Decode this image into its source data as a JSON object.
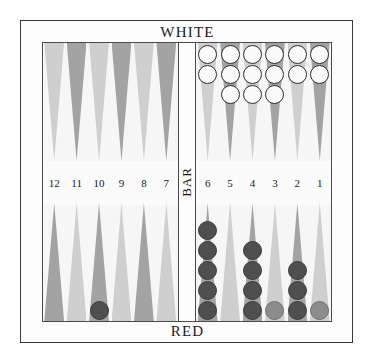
{
  "board": {
    "title_top": "WHITE",
    "title_bottom": "RED",
    "bar_label": "BAR",
    "colors": {
      "point_light": "#cfcfcf",
      "point_dark": "#a3a3a3",
      "checker_white": "#fbfbfb",
      "checker_red": "#4f4f4f",
      "checker_red_light": "#8d8d8d",
      "frame": "#3a3a3a",
      "felt": "#f6f6f6"
    }
  },
  "points": {
    "left_top": [
      {
        "number": "12",
        "shade": "light",
        "checkers": 0,
        "color": "none"
      },
      {
        "number": "11",
        "shade": "dark",
        "checkers": 0,
        "color": "none"
      },
      {
        "number": "10",
        "shade": "light",
        "checkers": 0,
        "color": "none"
      },
      {
        "number": "9",
        "shade": "dark",
        "checkers": 0,
        "color": "none"
      },
      {
        "number": "8",
        "shade": "light",
        "checkers": 0,
        "color": "none"
      },
      {
        "number": "7",
        "shade": "dark",
        "checkers": 0,
        "color": "none"
      }
    ],
    "right_top": [
      {
        "number": "6",
        "shade": "light",
        "checkers": 2,
        "color": "white"
      },
      {
        "number": "5",
        "shade": "dark",
        "checkers": 3,
        "color": "white"
      },
      {
        "number": "4",
        "shade": "light",
        "checkers": 3,
        "color": "white"
      },
      {
        "number": "3",
        "shade": "dark",
        "checkers": 3,
        "color": "white"
      },
      {
        "number": "2",
        "shade": "light",
        "checkers": 2,
        "color": "white"
      },
      {
        "number": "1",
        "shade": "dark",
        "checkers": 2,
        "color": "white"
      }
    ],
    "left_bottom": [
      {
        "number": "12",
        "shade": "dark",
        "checkers": 0,
        "color": "none"
      },
      {
        "number": "11",
        "shade": "light",
        "checkers": 0,
        "color": "none"
      },
      {
        "number": "10",
        "shade": "dark",
        "checkers": 1,
        "color": "red"
      },
      {
        "number": "9",
        "shade": "light",
        "checkers": 0,
        "color": "none"
      },
      {
        "number": "8",
        "shade": "dark",
        "checkers": 0,
        "color": "none"
      },
      {
        "number": "7",
        "shade": "light",
        "checkers": 0,
        "color": "none"
      }
    ],
    "right_bottom": [
      {
        "number": "6",
        "shade": "dark",
        "checkers": 5,
        "color": "red"
      },
      {
        "number": "5",
        "shade": "light",
        "checkers": 0,
        "color": "none"
      },
      {
        "number": "4",
        "shade": "dark",
        "checkers": 4,
        "color": "red"
      },
      {
        "number": "3",
        "shade": "light",
        "checkers": 1,
        "color": "red-light"
      },
      {
        "number": "2",
        "shade": "dark",
        "checkers": 3,
        "color": "red"
      },
      {
        "number": "1",
        "shade": "light",
        "checkers": 1,
        "color": "red-light"
      }
    ]
  },
  "numbers": {
    "left": [
      "12",
      "11",
      "10",
      "9",
      "8",
      "7"
    ],
    "right": [
      "6",
      "5",
      "4",
      "3",
      "2",
      "1"
    ]
  }
}
